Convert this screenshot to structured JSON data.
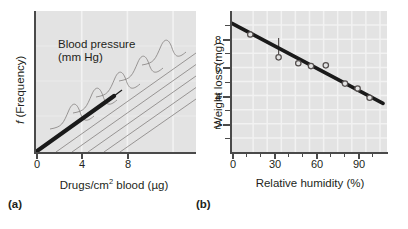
{
  "figure": {
    "panels": [
      {
        "caption": "(a)",
        "annotation_line1": "Blood pressure",
        "annotation_line2": "(mm Hg)",
        "xlabel_part1": "Drugs/cm",
        "xlabel_sup": "2",
        "xlabel_part2": " blood (µg)",
        "ylabel_italic": "f",
        "ylabel_rest": " (Frequency)"
      },
      {
        "caption": "(b)",
        "xlabel": "Relative humidity (%)",
        "ylabel": "Weight loss (mg)"
      }
    ]
  },
  "chart_data": [
    {
      "type": "line",
      "title": "",
      "subtitle": "Conceptual regression with normal frequency distributions about the line",
      "panel": "(a)",
      "xlabel": "Drugs/cm2 blood (µg)",
      "ylabel": "f (Frequency)",
      "xlim": [
        0,
        14
      ],
      "ylim": [
        0,
        10
      ],
      "xticks": [
        0,
        4,
        8
      ],
      "xticklabels": [
        "0",
        "4",
        "8"
      ],
      "yticks": [],
      "yticklabels": [],
      "grid": "vertical-only",
      "annotations": [
        {
          "text": "Blood pressure (mm Hg)",
          "x": 2.0,
          "y": 7.2,
          "points_to": "regression-line"
        }
      ],
      "series": [
        {
          "name": "Regression line (blood pressure)",
          "style": "thick-black-line",
          "x": [
            0,
            7.2
          ],
          "y": [
            0,
            5.4
          ]
        },
        {
          "name": "Normal frequency distributions",
          "style": "thin-gray-bell-curves-along-line",
          "count": 5,
          "centers_x": [
            4.0,
            6.1,
            8.2,
            10.3,
            12.4
          ],
          "centers_y": [
            3.0,
            4.6,
            6.1,
            7.7,
            9.3
          ]
        }
      ]
    },
    {
      "type": "scatter",
      "title": "",
      "panel": "(b)",
      "xlabel": "Relative humidity (%)",
      "ylabel": "Weight loss (mg)",
      "xlim": [
        -5,
        102
      ],
      "ylim": [
        0,
        9.6
      ],
      "xticks": [
        0,
        10,
        20,
        30,
        40,
        50,
        60,
        70,
        80,
        90,
        100
      ],
      "xticklabels": [
        "0",
        "",
        "",
        "30",
        "",
        "",
        "60",
        "",
        "",
        "90",
        ""
      ],
      "yticks": [
        1,
        2,
        3,
        4,
        5,
        6,
        7,
        8,
        9
      ],
      "yticklabels": [
        "",
        "2",
        "",
        "4",
        "",
        "6",
        "",
        "8",
        ""
      ],
      "grid": "both",
      "points": [
        {
          "x": 8.0,
          "y": 8.0,
          "residual_to_line": false
        },
        {
          "x": 28.0,
          "y": 6.4,
          "residual_to_line": true
        },
        {
          "x": 42.0,
          "y": 6.0,
          "residual_to_line": false
        },
        {
          "x": 51.0,
          "y": 5.8,
          "residual_to_line": false
        },
        {
          "x": 61.5,
          "y": 5.85,
          "residual_to_line": false
        },
        {
          "x": 75.0,
          "y": 4.55,
          "residual_to_line": false
        },
        {
          "x": 84.0,
          "y": 4.2,
          "residual_to_line": false
        },
        {
          "x": 92.5,
          "y": 3.55,
          "residual_to_line": false
        }
      ],
      "series": [
        {
          "name": "Least-squares regression line",
          "style": "thick-black-line",
          "x": [
            -3.0,
            100.0
          ],
          "y": [
            8.75,
            3.3
          ]
        }
      ]
    }
  ],
  "colors": {
    "plot_background": "#e3e3e3",
    "gridline": "#f2f2f2",
    "axis": "#4a4a4a",
    "line": "#1a1a1a",
    "marker_stroke": "#55504f",
    "curve": "#7d7a78",
    "text": "#231f20",
    "page_background": "#ffffff"
  }
}
